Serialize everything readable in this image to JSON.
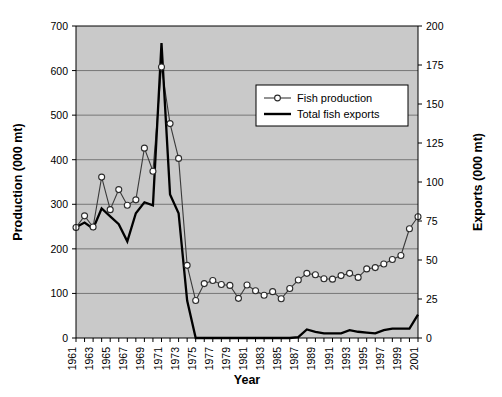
{
  "chart_data": {
    "type": "line",
    "title": "",
    "xlabel": "Year",
    "ylabel": "Production (000 mt)",
    "y2label": "Exports (000 mt)",
    "ylim": [
      0,
      700
    ],
    "y2lim": [
      0,
      200
    ],
    "xlim": [
      1961,
      2001
    ],
    "grid": true,
    "legend_position": "upper-right-inside",
    "y_ticks": [
      0,
      100,
      200,
      300,
      400,
      500,
      600,
      700
    ],
    "y2_ticks": [
      0,
      25,
      50,
      75,
      100,
      125,
      150,
      175,
      200
    ],
    "x_tick_labels": [
      "1961",
      "1963",
      "1965",
      "1967",
      "1969",
      "1971",
      "1973",
      "1975",
      "1977",
      "1979",
      "1981",
      "1983",
      "1985",
      "1987",
      "1989",
      "1991",
      "1993",
      "1995",
      "1997",
      "1999",
      "2001"
    ],
    "x": [
      1961,
      1962,
      1963,
      1964,
      1965,
      1966,
      1967,
      1968,
      1969,
      1970,
      1971,
      1972,
      1973,
      1974,
      1975,
      1976,
      1977,
      1978,
      1979,
      1980,
      1981,
      1982,
      1983,
      1984,
      1985,
      1986,
      1987,
      1988,
      1989,
      1990,
      1991,
      1992,
      1993,
      1994,
      1995,
      1996,
      1997,
      1998,
      1999,
      2000,
      2001
    ],
    "series": [
      {
        "name": "Fish production",
        "axis": "left",
        "unit": "000 mt",
        "marker": "open-circle",
        "values": [
          248,
          274,
          249,
          361,
          288,
          333,
          298,
          310,
          426,
          374,
          608,
          481,
          403,
          163,
          84,
          122,
          129,
          120,
          118,
          89,
          119,
          106,
          96,
          104,
          88,
          111,
          130,
          145,
          142,
          133,
          132,
          140,
          145,
          136,
          155,
          158,
          166,
          176,
          185,
          245,
          272
        ]
      },
      {
        "name": "Total fish exports",
        "axis": "right",
        "unit": "000 mt",
        "marker": "none",
        "values": [
          71,
          74,
          70,
          83,
          78,
          73,
          62,
          80,
          87,
          85,
          189,
          92,
          80,
          24,
          0,
          0,
          0,
          0,
          0,
          0,
          0,
          0,
          0,
          0,
          0,
          0,
          0.5,
          5.5,
          4,
          3,
          3,
          3,
          5,
          4,
          3.5,
          3,
          5,
          6,
          6,
          6,
          15
        ]
      }
    ]
  },
  "legend": {
    "entries": [
      {
        "label": "Fish production",
        "style": "line-marker"
      },
      {
        "label": "Total fish exports",
        "style": "line-thick"
      }
    ]
  },
  "axes": {
    "left_title": "Production (000 mt)",
    "right_title": "Exports (000 mt)",
    "bottom_title": "Year"
  }
}
